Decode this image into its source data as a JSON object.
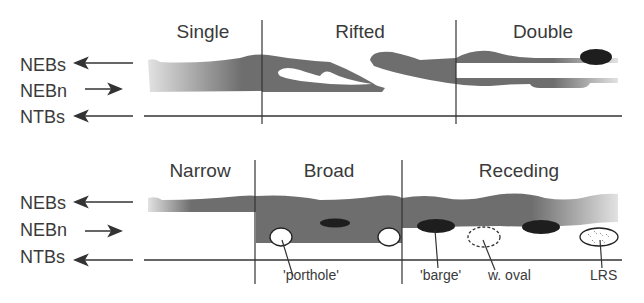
{
  "colors": {
    "band": "#6e6e6e",
    "line": "#333333",
    "dark": "#1e1e1e",
    "white": "#ffffff"
  },
  "top_panel": {
    "columns": [
      "Single",
      "Rifted",
      "Double"
    ],
    "row_labels": [
      "NEBs",
      "NEBn",
      "NTBs"
    ]
  },
  "bottom_panel": {
    "columns": [
      "Narrow",
      "Broad",
      "Receding"
    ],
    "row_labels": [
      "NEBs",
      "NEBn",
      "NTBs"
    ],
    "annotations": [
      "'porthole'",
      "'barge'",
      "w. oval",
      "LRS"
    ]
  }
}
